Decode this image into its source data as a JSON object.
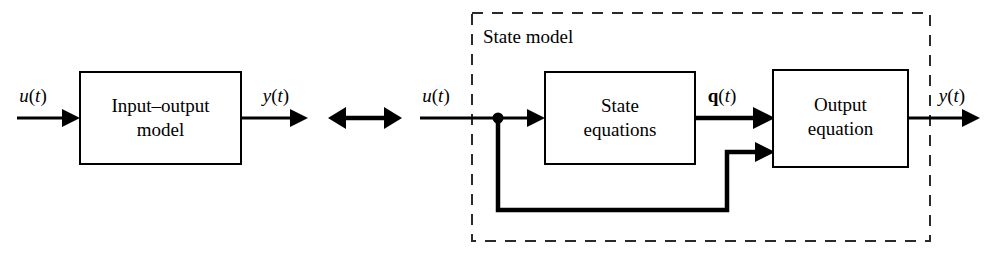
{
  "figure": {
    "kind": "block-diagram",
    "equivalence_symbol": "double-headed-arrow",
    "background_color": "#ffffff",
    "line_color": "#000000"
  },
  "left_model": {
    "block": {
      "label_line1": "Input–output",
      "label_line2": "model"
    },
    "input_signal": {
      "var": "u",
      "arg": "(t)",
      "label": "u(t)"
    },
    "output_signal": {
      "var": "y",
      "arg": "(t)",
      "label": "y(t)"
    }
  },
  "right_model": {
    "group": {
      "label": "State model",
      "border_style": "dashed"
    },
    "state_block": {
      "label_line1": "State",
      "label_line2": "equations"
    },
    "output_block": {
      "label_line1": "Output",
      "label_line2": "equation"
    },
    "input_signal": {
      "var": "u",
      "arg": "(t)",
      "label": "u(t)"
    },
    "state_signal": {
      "var": "q",
      "arg": "(t)",
      "label": "q(t)",
      "bold": true
    },
    "output_signal": {
      "var": "y",
      "arg": "(t)",
      "label": "y(t)"
    },
    "feedthrough_path": {
      "description": "u(t) branch to output equation second input"
    }
  }
}
